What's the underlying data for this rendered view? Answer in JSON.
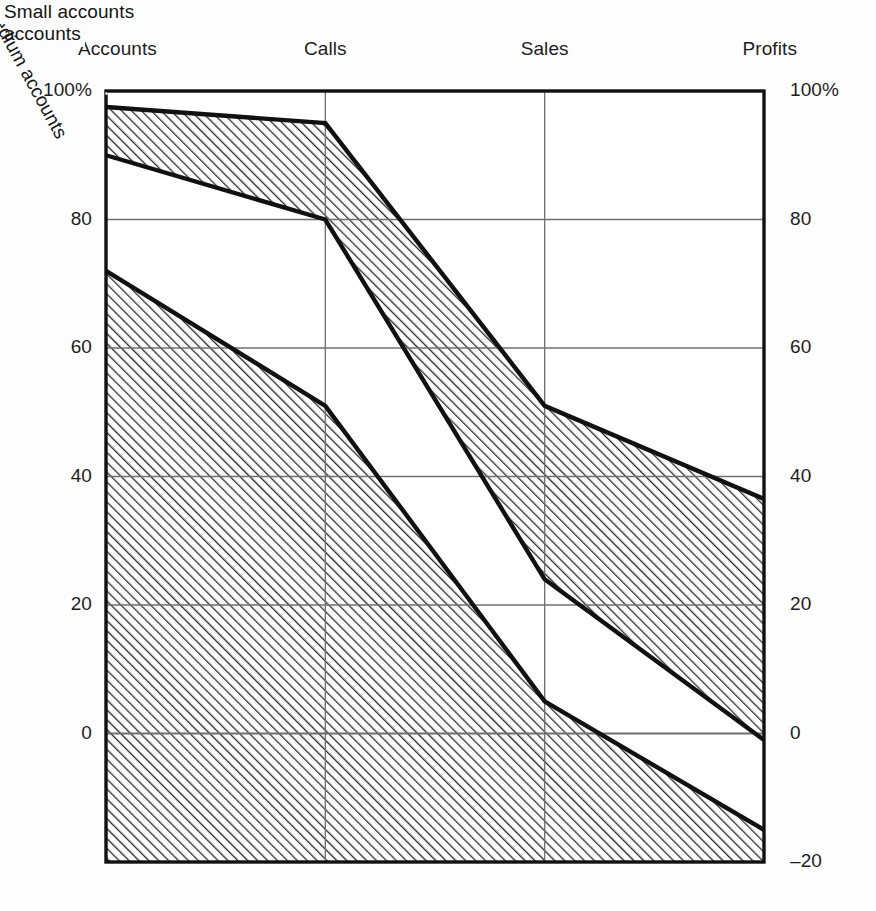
{
  "chart_data": {
    "type": "area",
    "title": "",
    "subtitle": "",
    "xlabel": "",
    "ylabel": "",
    "grid": true,
    "legend_position": "inline-annotations",
    "categories": [
      "Accounts",
      "Calls",
      "Sales",
      "Profits"
    ],
    "axis_left": {
      "ticks": [
        100,
        80,
        60,
        40,
        20,
        0
      ],
      "tick_labels": [
        "100%",
        "80",
        "60",
        "40",
        "20",
        "0"
      ],
      "ylim": [
        -20,
        100
      ]
    },
    "axis_right": {
      "ticks": [
        100,
        80,
        60,
        40,
        20,
        0,
        -20
      ],
      "tick_labels": [
        "100%",
        "80",
        "60",
        "40",
        "20",
        "0",
        "–20"
      ],
      "ylim": [
        -20,
        100
      ]
    },
    "series": [
      {
        "name": "Key accounts",
        "fill": "white",
        "upper_values": [
          100,
          100,
          100,
          100
        ],
        "lower_values": [
          97.5,
          95,
          51,
          36.5
        ]
      },
      {
        "name": "Large accounts",
        "fill": "hatch",
        "upper_values": [
          97.5,
          95,
          51,
          36.5
        ],
        "lower_values": [
          90,
          80,
          24,
          -1
        ]
      },
      {
        "name": "Medium accounts",
        "fill": "white",
        "upper_values": [
          90,
          80,
          24,
          -1
        ],
        "lower_values": [
          72,
          51,
          5,
          -15
        ]
      },
      {
        "name": "Small accounts",
        "fill": "hatch",
        "upper_values": [
          72,
          51,
          5,
          -15
        ],
        "lower_values": [
          -20,
          -20,
          -20,
          -20
        ]
      }
    ],
    "annotations": [
      {
        "text": "Key accounts",
        "x_pct": 0.68,
        "value": 71,
        "rotation": 0
      },
      {
        "text": "Large\naccounts",
        "x_pct": 0.855,
        "value": 28,
        "rotation": 0
      },
      {
        "text": "Medium accounts",
        "x_pct": 0.5,
        "value": 38,
        "rotation": 61.5
      },
      {
        "text": "Small accounts",
        "x_pct": 0.34,
        "value": -8,
        "rotation": 0
      }
    ]
  },
  "labels": {
    "cat_accounts": "Accounts",
    "cat_calls": "Calls",
    "cat_sales": "Sales",
    "cat_profits": "Profits",
    "left_100": "100%",
    "left_80": "80",
    "left_60": "60",
    "left_40": "40",
    "left_20": "20",
    "left_0": "0",
    "right_100": "100%",
    "right_80": "80",
    "right_60": "60",
    "right_40": "40",
    "right_20": "20",
    "right_0": "0",
    "right_m20": "–20",
    "band_key": "Key accounts",
    "band_large_line1": "Large",
    "band_large_line2": "accounts",
    "band_medium": "Medium accounts",
    "band_small": "Small accounts"
  },
  "colors": {
    "ink": "#1b1b1b",
    "frame": "#111111",
    "gridline": "#6f6f6f",
    "hatch": "#2a2a2a",
    "paper": "#fefefe",
    "label_bg": "#fdfdfd"
  }
}
